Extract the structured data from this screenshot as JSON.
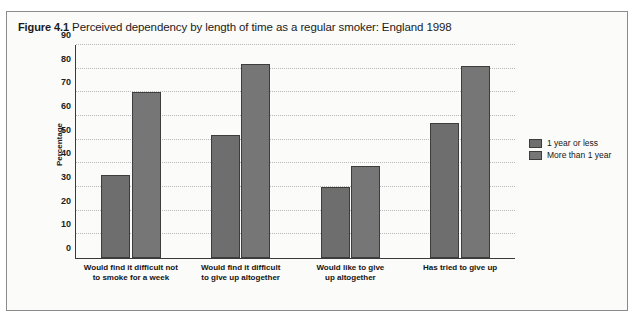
{
  "figure": {
    "number": "Figure 4.1",
    "title": "Perceived dependency by length of time as a regular smoker: England 1998"
  },
  "chart_data": {
    "type": "bar",
    "title": "Perceived dependency by length of time as a regular smoker: England 1998",
    "xlabel": "",
    "ylabel": "Percentage",
    "ylim": [
      0,
      90
    ],
    "yticks": [
      0,
      10,
      20,
      30,
      40,
      50,
      60,
      70,
      80,
      90
    ],
    "ytick_labels": [
      "0",
      "10",
      "20",
      "30",
      "40",
      "50",
      "60",
      "70",
      "80",
      "90"
    ],
    "grid": true,
    "legend_position": "right",
    "categories": [
      "Would find it difficult not\nto smoke for a week",
      "Would find it difficult\nto give up altogether",
      "Would like  to give\nup altogether",
      "Has tried to give up"
    ],
    "series": [
      {
        "name": "1 year or less",
        "color": "#6e6e6e",
        "values": [
          35,
          52,
          30,
          57
        ]
      },
      {
        "name": "More than 1 year",
        "color": "#767676",
        "values": [
          70,
          82,
          39,
          81
        ]
      }
    ]
  }
}
